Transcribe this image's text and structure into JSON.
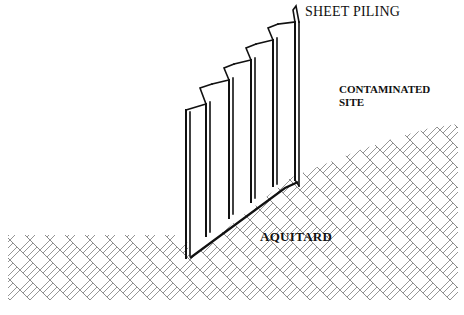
{
  "diagram": {
    "type": "cross-section illustration",
    "labels": {
      "sheet_piling": "SHEET PILING",
      "contaminated_site_line1": "CONTAMINATED",
      "contaminated_site_line2": "SITE",
      "aquitard": "AQUITARD"
    },
    "colors": {
      "line": "#111111",
      "hatch": "#8a8a8a",
      "background": "#ffffff"
    },
    "components": [
      {
        "name": "sheet-piling",
        "description": "Corrugated (zigzag) steel sheet piling wall, stepped top profile"
      },
      {
        "name": "aquitard",
        "description": "Low-permeability layer shown with herringbone brick hatch"
      },
      {
        "name": "contaminated-site",
        "description": "Area upslope behind sheet piling"
      }
    ]
  }
}
